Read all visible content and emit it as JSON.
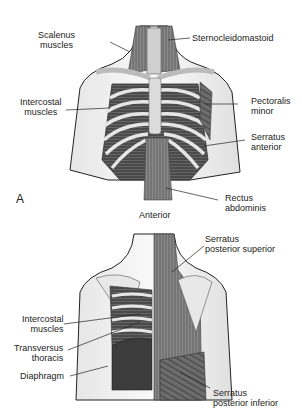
{
  "figure": {
    "panel_a": {
      "letter": "A",
      "caption": "Anterior",
      "labels": {
        "scalenus": [
          "Scalenus",
          "muscles"
        ],
        "sternocleidomastoid": "Sternocleidomastoid",
        "intercostal": [
          "Intercostal",
          "muscles"
        ],
        "pectoralis": [
          "Pectoralis",
          "minor"
        ],
        "serratus_anterior": [
          "Serratus",
          "anterior"
        ],
        "rectus": [
          "Rectus",
          "abdominis"
        ]
      }
    },
    "panel_b": {
      "labels": {
        "serratus_post_sup": [
          "Serratus",
          "posterior superior"
        ],
        "intercostal": [
          "Intercostal",
          "muscles"
        ],
        "transversus": [
          "Transversus",
          "thoracis"
        ],
        "diaphragm": "Diaphragm",
        "serratus_post_inf": [
          "Serratus",
          "posterior inferior"
        ]
      }
    }
  }
}
